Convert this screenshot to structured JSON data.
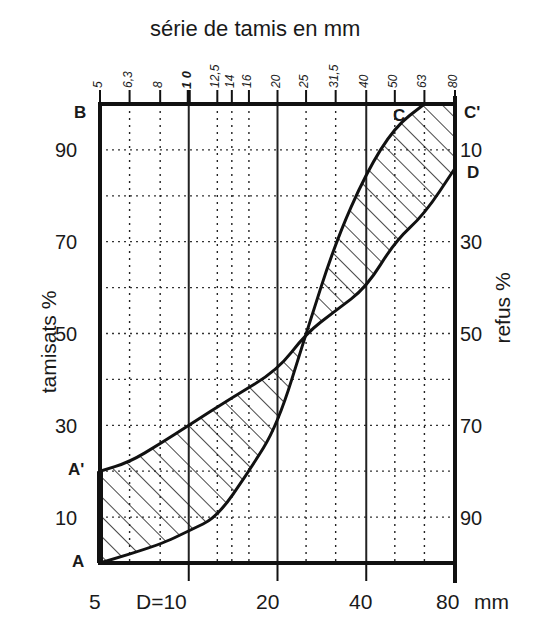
{
  "chart_data": {
    "type": "line",
    "title": "série de tamis en mm",
    "xlabel": "mm",
    "ylabel_left": "tamisats %",
    "ylabel_right": "refus %",
    "x_scale": "log",
    "xlim": [
      5,
      80
    ],
    "ylim": [
      0,
      100
    ],
    "top_ticks": [
      "5",
      "6,3",
      "8",
      "10",
      "12,5",
      "14",
      "16",
      "20",
      "25",
      "31,5",
      "40",
      "50",
      "63",
      "80"
    ],
    "top_tick_values": [
      5,
      6.3,
      8,
      10,
      12.5,
      14,
      16,
      20,
      25,
      31.5,
      40,
      50,
      63,
      80
    ],
    "bottom_ticks": [
      "5",
      "D=10",
      "20",
      "40",
      "80 mm"
    ],
    "left_ticks": [
      "10",
      "30",
      "50",
      "70",
      "90"
    ],
    "right_ticks": [
      "90",
      "70",
      "50",
      "30",
      "10"
    ],
    "grid": true,
    "point_labels": [
      "A",
      "A'",
      "B",
      "C",
      "C'",
      "D"
    ],
    "series": [
      {
        "name": "A-C",
        "x": [
          5,
          8,
          10,
          12.5,
          16,
          20,
          25,
          31.5,
          40,
          50,
          63
        ],
        "y": [
          0,
          4,
          7,
          10,
          20,
          30,
          50,
          70,
          85,
          95,
          100
        ]
      },
      {
        "name": "A'-D",
        "x": [
          5,
          6.3,
          8,
          10,
          14,
          20,
          25,
          31.5,
          40,
          50,
          63,
          80
        ],
        "y": [
          20,
          22,
          26,
          30,
          36,
          42,
          50,
          55,
          60,
          70,
          76,
          86
        ]
      }
    ],
    "shaded_region": "between A-C and A'-D (hatched)"
  },
  "labels": {
    "title": "série de tamis en mm",
    "left_axis": "tamisats %",
    "right_axis": "refus %",
    "A": "A",
    "A_prime": "A'",
    "B": "B",
    "C": "C",
    "C_prime": "C'",
    "D": "D",
    "left_ticks": [
      "90",
      "70",
      "50",
      "30",
      "10"
    ],
    "right_ticks": [
      "10",
      "30",
      "50",
      "70",
      "90"
    ],
    "bottom_ticks": [
      "5",
      "D=10",
      "20",
      "40",
      "80",
      "mm"
    ],
    "top_ticks": [
      "5",
      "6,3",
      "8",
      "1 0",
      "12,5",
      "14",
      "16",
      "20",
      "25",
      "31,5",
      "40",
      "50",
      "63",
      "80"
    ]
  }
}
